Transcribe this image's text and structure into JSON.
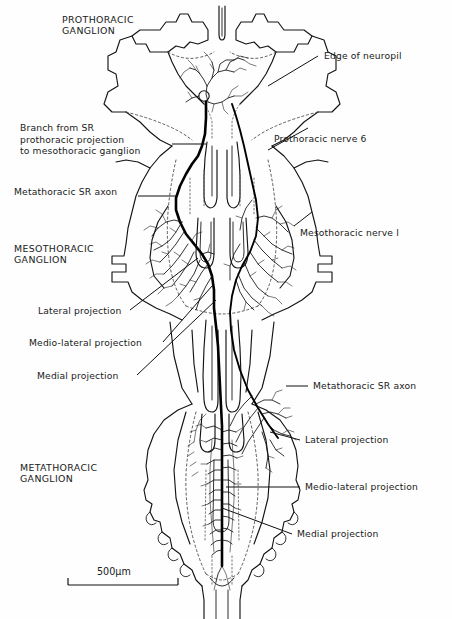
{
  "figure": {
    "type": "camera-lucida-neuroanatomy-drawing",
    "background_color": "#fefefe",
    "ink_color": "#111111"
  },
  "labels": {
    "prothoracic_ganglion": "PROTHORACIC\nGANGLION",
    "mesothoracic_ganglion": "MESOTHORACIC\nGANGLION",
    "metathoracic_ganglion": "METATHORACIC\nGANGLION",
    "branch_from_sr": "Branch from SR\nprothoracic projection\nto mesothoracic ganglion",
    "metathoracic_sr_axon_left": "Metathoracic SR axon",
    "lateral_projection_meso": "Lateral projection",
    "medio_lateral_projection_meso": "Medio-lateral projection",
    "medial_projection_meso": "Medial projection",
    "edge_of_neuropil": "Edge of neuropil",
    "prothoracic_nerve_6": "Prothoracic nerve 6",
    "mesothoracic_nerve_1": "Mesothoracic nerve l",
    "metathoracic_sr_axon_right": "Metathoracic SR axon",
    "lateral_projection_meta": "Lateral projection",
    "medio_lateral_projection_meta": "Medio-lateral projection",
    "medial_projection_meta": "Medial projection"
  },
  "scale_bar": {
    "value": "500",
    "unit": "μm",
    "text": "500μm"
  },
  "colors": {
    "ink": "#111111",
    "light_ink": "#3a3a3a",
    "dotted_neuropil": "#555555",
    "background": "#fefefe"
  }
}
